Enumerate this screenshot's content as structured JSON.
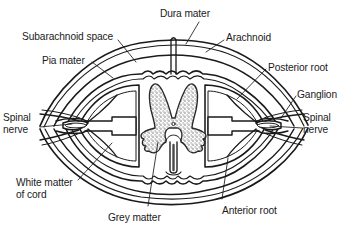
{
  "figure": {
    "type": "anatomical-diagram",
    "background_color": "#ffffff",
    "line_color": "#1a1a1a",
    "stipple_color": "#6e6e6e"
  },
  "labels": [
    {
      "id": "dura-mater",
      "text": "Dura mater",
      "x": 160,
      "y": 8,
      "align": "left"
    },
    {
      "id": "subarachnoid",
      "text": "Subarachnoid space",
      "x": 22,
      "y": 31,
      "align": "left"
    },
    {
      "id": "arachnoid",
      "text": "Arachnoid",
      "x": 226,
      "y": 32,
      "align": "left"
    },
    {
      "id": "pia-mater",
      "text": "Pia mater",
      "x": 42,
      "y": 55,
      "align": "left"
    },
    {
      "id": "posterior-root",
      "text": "Posterior root",
      "x": 268,
      "y": 62,
      "align": "left"
    },
    {
      "id": "ganglion",
      "text": "Ganglion",
      "x": 297,
      "y": 89,
      "align": "left"
    },
    {
      "id": "spinal-nerve-left",
      "text": "Spinal\nnerve",
      "x": 3,
      "y": 112,
      "align": "left"
    },
    {
      "id": "spinal-nerve-right",
      "text": "Spinal\nnerve",
      "x": 303,
      "y": 112,
      "align": "left"
    },
    {
      "id": "white-matter",
      "text": "White matter\nof cord",
      "x": 16,
      "y": 177,
      "align": "left"
    },
    {
      "id": "grey-matter",
      "text": "Grey matter",
      "x": 108,
      "y": 212,
      "align": "left"
    },
    {
      "id": "anterior-root",
      "text": "Anterior root",
      "x": 222,
      "y": 205,
      "align": "left"
    }
  ],
  "leader_lines": [
    {
      "id": "leader-dura-mater",
      "points": "199,22 186,44"
    },
    {
      "id": "leader-subarachnoid",
      "points": "118,40 136,62"
    },
    {
      "id": "leader-arachnoid",
      "points": "224,40 206,52"
    },
    {
      "id": "leader-pia-mater",
      "points": "92,62 113,78"
    },
    {
      "id": "leader-posterior-root",
      "points": "266,69 237,99"
    },
    {
      "id": "leader-ganglion",
      "points": "296,96 281,118"
    },
    {
      "id": "leader-spinal-nerve-left",
      "points": "40,127 72,124"
    },
    {
      "id": "leader-spinal-nerve-right",
      "points": "302,128 270,126"
    },
    {
      "id": "leader-white-matter",
      "points": "78,180 112,143"
    },
    {
      "id": "leader-grey-matter",
      "points": "148,206 158,142"
    },
    {
      "id": "leader-anterior-root",
      "points": "222,199 228,158"
    }
  ],
  "structures": [
    {
      "id": "dura-mater-outer",
      "name": "dura-mater-outer-layer"
    },
    {
      "id": "arachnoid-layer",
      "name": "arachnoid-layer"
    },
    {
      "id": "subarachnoid-space",
      "name": "subarachnoid-space"
    },
    {
      "id": "pia-mater-layer",
      "name": "pia-mater-layer"
    },
    {
      "id": "white-matter-cord",
      "name": "white-matter-of-cord"
    },
    {
      "id": "grey-matter-butterfly",
      "name": "grey-matter-butterfly"
    },
    {
      "id": "central-canal",
      "name": "central-canal"
    },
    {
      "id": "anterior-median-fissure",
      "name": "anterior-median-fissure"
    },
    {
      "id": "posterior-septum",
      "name": "posterior-median-septum"
    },
    {
      "id": "ganglion-left",
      "name": "ganglion-left"
    },
    {
      "id": "ganglion-right",
      "name": "ganglion-right"
    },
    {
      "id": "posterior-root-left",
      "name": "posterior-root-left"
    },
    {
      "id": "posterior-root-right",
      "name": "posterior-root-right"
    },
    {
      "id": "anterior-root-left",
      "name": "anterior-root-left"
    },
    {
      "id": "anterior-root-right",
      "name": "anterior-root-right"
    },
    {
      "id": "spinal-nerve-left",
      "name": "spinal-nerve-left"
    },
    {
      "id": "spinal-nerve-right",
      "name": "spinal-nerve-right"
    }
  ]
}
